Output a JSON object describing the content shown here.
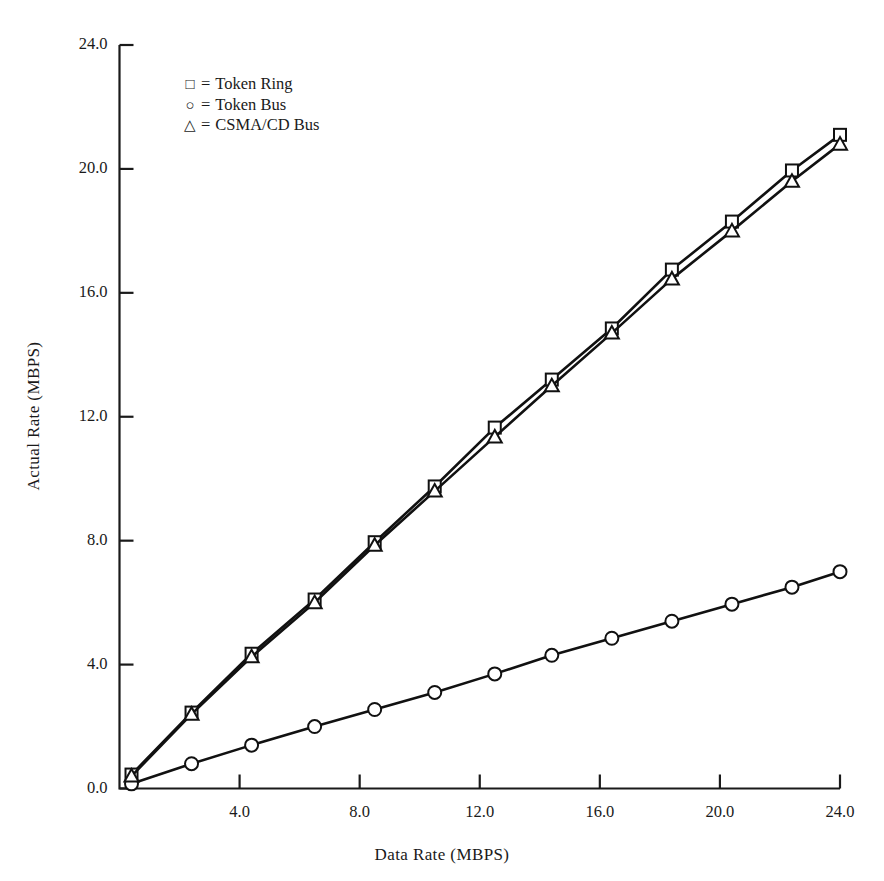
{
  "chart_data": {
    "type": "line",
    "title": "",
    "xlabel": "Data Rate (MBPS)",
    "ylabel": "Actual Rate (MBPS)",
    "xlim": [
      0,
      24
    ],
    "ylim": [
      0,
      24
    ],
    "xticks": [
      "4.0",
      "8.0",
      "12.0",
      "16.0",
      "20.0",
      "24.0"
    ],
    "xtick_values": [
      4,
      8,
      12,
      16,
      20,
      24
    ],
    "yticks": [
      "0.0",
      "4.0",
      "8.0",
      "12.0",
      "16.0",
      "20.0",
      "24.0"
    ],
    "ytick_values": [
      0,
      4,
      8,
      12,
      16,
      20,
      24
    ],
    "grid": false,
    "legend_position": "upper-left-inside",
    "marker_legend": [
      {
        "symbol": "square",
        "glyph": "□",
        "equals": "=",
        "label": "Token Ring"
      },
      {
        "symbol": "circle",
        "glyph": "○",
        "equals": "=",
        "label": "Token Bus"
      },
      {
        "symbol": "triangle",
        "glyph": "△",
        "equals": "=",
        "label": "CSMA/CD Bus"
      }
    ],
    "x": [
      0.4,
      2.4,
      4.4,
      6.5,
      8.5,
      10.5,
      12.5,
      14.4,
      16.4,
      18.4,
      20.4,
      22.4,
      24.0
    ],
    "series": [
      {
        "name": "Token Ring",
        "marker": "square",
        "values": [
          0.45,
          2.45,
          4.35,
          6.1,
          7.95,
          9.75,
          11.65,
          13.2,
          16.75,
          18.3,
          19.95,
          21.1,
          21.1
        ]
      },
      {
        "name": "Token Bus",
        "marker": "circle",
        "values": [
          0.15,
          0.8,
          1.4,
          2.0,
          2.55,
          3.1,
          3.7,
          4.3,
          4.85,
          5.4,
          5.95,
          6.5,
          7.0
        ]
      },
      {
        "name": "CSMA/CD Bus",
        "marker": "triangle",
        "values": [
          0.4,
          2.4,
          4.25,
          6.0,
          7.85,
          9.6,
          11.35,
          13.0,
          16.45,
          18.0,
          19.6,
          20.8,
          20.8
        ]
      }
    ],
    "series_points": [
      {
        "name": "Token Ring",
        "marker": "square",
        "points": [
          [
            0.4,
            0.45
          ],
          [
            2.4,
            2.45
          ],
          [
            4.4,
            4.35
          ],
          [
            6.5,
            6.1
          ],
          [
            8.5,
            7.95
          ],
          [
            10.5,
            9.75
          ],
          [
            12.5,
            11.65
          ],
          [
            14.4,
            13.2
          ],
          [
            16.4,
            14.85
          ],
          [
            18.4,
            16.75
          ],
          [
            20.4,
            18.3
          ],
          [
            22.4,
            19.95
          ],
          [
            24.0,
            21.1
          ]
        ]
      },
      {
        "name": "Token Bus",
        "marker": "circle",
        "points": [
          [
            0.4,
            0.15
          ],
          [
            2.4,
            0.8
          ],
          [
            4.4,
            1.4
          ],
          [
            6.5,
            2.0
          ],
          [
            8.5,
            2.55
          ],
          [
            10.5,
            3.1
          ],
          [
            12.5,
            3.7
          ],
          [
            14.4,
            4.3
          ],
          [
            16.4,
            4.85
          ],
          [
            18.4,
            5.4
          ],
          [
            20.4,
            5.95
          ],
          [
            22.4,
            6.5
          ],
          [
            24.0,
            7.0
          ]
        ]
      },
      {
        "name": "CSMA/CD Bus",
        "marker": "triangle",
        "points": [
          [
            0.4,
            0.4
          ],
          [
            2.4,
            2.4
          ],
          [
            4.4,
            4.25
          ],
          [
            6.5,
            6.0
          ],
          [
            8.5,
            7.85
          ],
          [
            10.5,
            9.6
          ],
          [
            12.5,
            11.35
          ],
          [
            14.4,
            13.0
          ],
          [
            16.4,
            14.7
          ],
          [
            18.4,
            16.45
          ],
          [
            20.4,
            18.0
          ],
          [
            22.4,
            19.6
          ],
          [
            24.0,
            20.8
          ]
        ]
      }
    ],
    "colors": {
      "line": "#111111",
      "axis": "#1a1a1a",
      "background": "#ffffff"
    }
  }
}
